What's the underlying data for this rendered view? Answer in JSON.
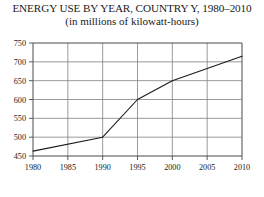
{
  "chart_data": {
    "type": "line",
    "title": "ENERGY USE BY YEAR, COUNTRY Y, 1980–2010",
    "subtitle": "(in millions of kilowatt-hours)",
    "xlabel": "",
    "ylabel": "",
    "x": [
      1980,
      1990,
      1995,
      2000,
      2010
    ],
    "values": [
      463,
      500,
      600,
      650,
      715
    ],
    "series": [
      {
        "name": "Energy use",
        "values": [
          463,
          500,
          600,
          650,
          715
        ]
      }
    ],
    "xlim": [
      1980,
      2010
    ],
    "ylim": [
      450,
      750
    ],
    "xticks": [
      1980,
      1985,
      1990,
      1995,
      2000,
      2005,
      2010
    ],
    "xtick_labels": [
      "1980",
      "1985",
      "1990",
      "1995",
      "2000",
      "2005",
      "2010"
    ],
    "yticks": [
      450,
      500,
      550,
      600,
      650,
      700,
      750
    ],
    "ytick_labels": [
      "450",
      "500",
      "550",
      "600",
      "650",
      "700",
      "750"
    ],
    "grid": true,
    "legend": false,
    "line_color": "#1a1a1a",
    "grid_color": "#808080",
    "background_color": "#ffffff"
  }
}
